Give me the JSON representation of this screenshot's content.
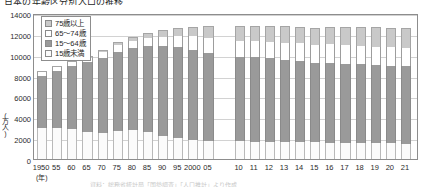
{
  "title": "日本の年齢区分別人口の推移",
  "axes": {
    "y_unit": "(万人)",
    "y_ticks": [
      "14000",
      "12000",
      "10000",
      "8000",
      "6000",
      "4000",
      "2000",
      "0"
    ],
    "x_unit": "(年)"
  },
  "legend": {
    "items": [
      {
        "key": "o75",
        "label": "75歳以上",
        "color": "#c9c9c9"
      },
      {
        "key": "s6574",
        "label": "65〜74歳",
        "color": "#ffffff"
      },
      {
        "key": "w1564",
        "label": "15〜64歳",
        "color": "#9a9a9a"
      },
      {
        "key": "u15",
        "label": "15歳未満",
        "color": "#fbfbfb"
      }
    ]
  },
  "source": "資料：総務省統計局「国勢調査」「人口推計」より作成",
  "chart_data": {
    "type": "bar",
    "stacked": true,
    "title": "日本の年齢区分別人口の推移",
    "xlabel": "(年)",
    "ylabel": "(万人)",
    "ylim": [
      0,
      14000
    ],
    "ytick_step": 2000,
    "grid": true,
    "legend_position": "top-left-inside",
    "categories": [
      "1950",
      "55",
      "60",
      "65",
      "70",
      "75",
      "80",
      "85",
      "90",
      "95",
      "2000",
      "05",
      "10",
      "11",
      "12",
      "13",
      "14",
      "15",
      "16",
      "17",
      "18",
      "19",
      "20",
      "21"
    ],
    "series": [
      {
        "name": "15歳未満",
        "key": "u15",
        "values": [
          2979,
          2980,
          2843,
          2553,
          2515,
          2722,
          2751,
          2603,
          2249,
          2003,
          1851,
          1759,
          1684,
          1669,
          1655,
          1639,
          1623,
          1589,
          1578,
          1559,
          1542,
          1521,
          1503,
          1478
        ]
      },
      {
        "name": "15〜64歳",
        "key": "w1564",
        "values": [
          5017,
          5473,
          6047,
          6744,
          7212,
          7581,
          7883,
          8251,
          8590,
          8716,
          8622,
          8409,
          8103,
          8134,
          8018,
          7901,
          7785,
          7629,
          7656,
          7596,
          7545,
          7507,
          7449,
          7450
        ]
      },
      {
        "name": "65〜74歳",
        "key": "s6574",
        "values": [
          309,
          338,
          376,
          423,
          517,
          611,
          699,
          776,
          892,
          1109,
          1301,
          1407,
          1529,
          1500,
          1560,
          1630,
          1708,
          1752,
          1768,
          1767,
          1760,
          1740,
          1747,
          1754
        ]
      },
      {
        "name": "75歳以上",
        "key": "o75",
        "values": [
          107,
          123,
          139,
          164,
          221,
          284,
          366,
          471,
          597,
          717,
          900,
          1164,
          1419,
          1478,
          1519,
          1560,
          1592,
          1632,
          1691,
          1748,
          1798,
          1849,
          1872,
          1867
        ]
      }
    ],
    "totals": [
      8412,
      8914,
      9405,
      9884,
      10465,
      11198,
      11699,
      12101,
      12328,
      12545,
      12674,
      12739,
      12735,
      12781,
      12752,
      12730,
      12708,
      12602,
      12693,
      12670,
      12645,
      12617,
      12571,
      12549
    ],
    "gap_between": {
      "after_category": "05",
      "before_category": "10"
    }
  }
}
